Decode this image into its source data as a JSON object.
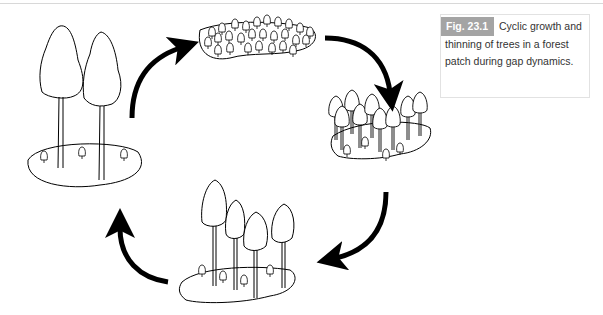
{
  "figure": {
    "label": "Fig. 23.1",
    "caption": "Cyclic growth and thinning of trees in a forest patch during gap dynamics.",
    "caption_label_color": "#a4a4a4",
    "stages": [
      {
        "name": "mature-two-tall-trees",
        "description": "Two tall mature trees with three seedlings"
      },
      {
        "name": "dense-seedling-patch",
        "description": "Dense patch of many seedlings"
      },
      {
        "name": "thinning-young-trees",
        "description": "Many young trees competing"
      },
      {
        "name": "intermediate-trees",
        "description": "Fewer taller trees with seedlings"
      }
    ],
    "arrows": [
      "mature-to-seedlings",
      "seedlings-to-young",
      "young-to-intermediate",
      "intermediate-to-mature"
    ]
  }
}
